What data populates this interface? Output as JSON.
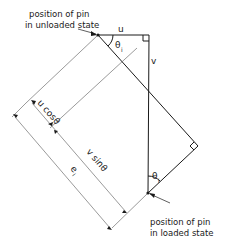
{
  "diagram": {
    "labels": {
      "unloaded_line1": "position of pin",
      "unloaded_line2": "in unloaded state",
      "loaded_line1": "position of pin",
      "loaded_line2": "in loaded state",
      "u": "u",
      "v": "v",
      "theta_top": "θ",
      "theta_top_sub": "i",
      "theta_bottom": "θ",
      "theta_bottom_sub": "i",
      "u_cos": "u cosθ",
      "u_cos_sub": "i",
      "v_sin": "v sinθ",
      "v_sin_sub": "i",
      "e": "e",
      "e_sub": "i"
    },
    "colors": {
      "line": "#1a1a1a",
      "thin": "#555555"
    }
  }
}
